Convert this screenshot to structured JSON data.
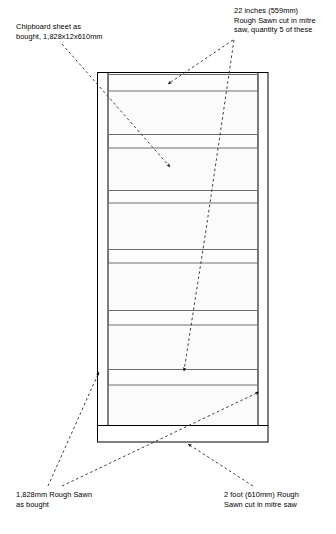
{
  "diagram": {
    "type": "technical-drawing",
    "colors": {
      "outline": "#000000",
      "panel_fill": "#fbfbfb",
      "crosspiece_fill": "#fdfdfd",
      "crosspiece_edge": "#6e6e6e",
      "leader": "#2b2b2b",
      "background": "#ffffff"
    },
    "annotations": [
      {
        "id": "chipboard",
        "lines": [
          "Chipboard sheet as",
          "bought, 1,828x12x610mm"
        ]
      },
      {
        "id": "crosspiece",
        "lines": [
          "22 inches (559mm)",
          "Rough Sawn cut in mitre",
          "saw, quantity 5 of these"
        ]
      },
      {
        "id": "rail-length",
        "lines": [
          "1,828mm Rough Sawn",
          "as bought"
        ]
      },
      {
        "id": "rail-cut",
        "lines": [
          "2 foot (610mm) Rough",
          "Sawn cut in mitre saw"
        ]
      }
    ],
    "geometry": {
      "panel": {
        "x": 97,
        "y": 72,
        "width": 171,
        "height": 370
      },
      "left_rail": {
        "outer_x": 97,
        "inner_x": 108,
        "top": 72,
        "bottom": 425
      },
      "right_rail": {
        "inner_x": 258,
        "outer_x": 268,
        "top": 72,
        "bottom": 425
      },
      "bottom_rail": {
        "x": 97,
        "y": 425,
        "width": 171,
        "height": 17
      },
      "crosspieces": [
        {
          "index": 1,
          "y": 74,
          "height": 17
        },
        {
          "index": 2,
          "y": 134,
          "height": 14
        },
        {
          "index": 3,
          "y": 190,
          "height": 13
        },
        {
          "index": 4,
          "y": 249,
          "height": 14
        },
        {
          "index": 5,
          "y": 310,
          "height": 15
        },
        {
          "index": 6,
          "y": 369,
          "height": 16
        }
      ]
    }
  }
}
